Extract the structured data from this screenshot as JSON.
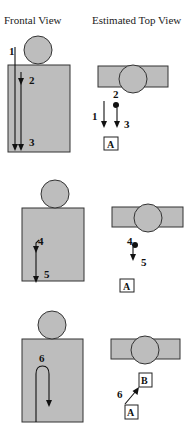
{
  "headers": {
    "frontal": "Frontal View",
    "top": "Estimated Top View"
  },
  "colors": {
    "body_fill": "#bdbdbd",
    "stroke": "#333333",
    "background": "#ffffff"
  },
  "panels": [
    {
      "frontal": {
        "labels": [
          "1",
          "2",
          "3"
        ]
      },
      "top": {
        "labels": [
          "2",
          "1",
          "3"
        ],
        "box": "A"
      }
    },
    {
      "frontal": {
        "labels": [
          "4",
          "5"
        ]
      },
      "top": {
        "labels": [
          "4",
          "5"
        ],
        "box": "A"
      }
    },
    {
      "frontal": {
        "labels": [
          "6"
        ]
      },
      "top": {
        "labels": [
          "6"
        ],
        "box_start": "A",
        "box_end": "B"
      }
    }
  ]
}
